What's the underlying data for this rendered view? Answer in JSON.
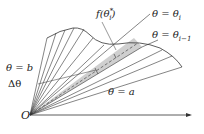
{
  "diagram": {
    "labels": {
      "origin": "O",
      "theta_b": "θ = b",
      "theta_a": "θ = a",
      "theta_i": "θ = θ",
      "theta_i_sub": "i",
      "theta_i1": "θ = θ",
      "theta_i1_sub": "i−1",
      "delta_theta": "Δθ",
      "f_theta": "f(θ",
      "f_theta_sup": "*",
      "f_theta_sub": "i",
      "f_theta_close": ")"
    },
    "colors": {
      "line": "#333333",
      "sector_fill": "#cfcfcf"
    }
  }
}
